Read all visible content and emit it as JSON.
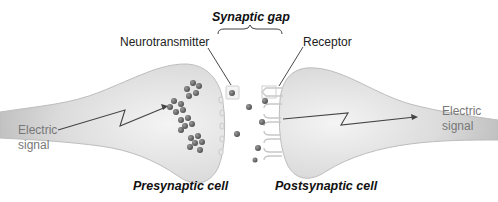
{
  "title": "Synaptic gap",
  "labels": {
    "synaptic_gap": "Synaptic gap",
    "neurotransmitter": "Neurotransmitter",
    "receptor": "Receptor",
    "electric_signal_left_1": "Electric",
    "electric_signal_left_2": "signal",
    "electric_signal_right_1": "Electric",
    "electric_signal_right_2": "signal",
    "presynaptic_cell": "Presynaptic cell",
    "postsynaptic_cell": "Postsynaptic cell"
  },
  "colors": {
    "cell_fill": "#d9d9d9",
    "cell_edge": "#b5b5b5",
    "vesicle": "#6b6b6b",
    "line": "#333333",
    "text": "#222222",
    "gray_text": "#777777"
  }
}
